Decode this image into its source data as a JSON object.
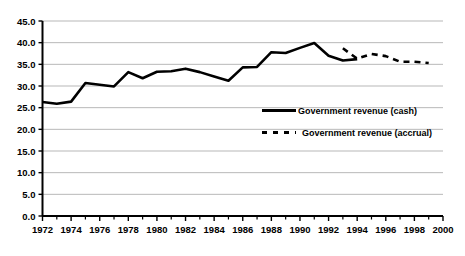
{
  "chart_data": {
    "type": "line",
    "title": "",
    "xlabel": "",
    "ylabel": "",
    "xlim": [
      1972,
      2000
    ],
    "ylim": [
      0.0,
      45.0
    ],
    "y_ticks": [
      "0.0",
      "5.0",
      "10.0",
      "15.0",
      "20.0",
      "25.0",
      "30.0",
      "35.0",
      "40.0",
      "45.0"
    ],
    "y_tick_values": [
      0.0,
      5.0,
      10.0,
      15.0,
      20.0,
      25.0,
      30.0,
      35.0,
      40.0,
      45.0
    ],
    "x_ticks": [
      "1972",
      "1974",
      "1976",
      "1978",
      "1980",
      "1982",
      "1984",
      "1986",
      "1988",
      "1990",
      "1992",
      "1994",
      "1996",
      "1998",
      "2000"
    ],
    "x_tick_values": [
      1972,
      1974,
      1976,
      1978,
      1980,
      1982,
      1984,
      1986,
      1988,
      1990,
      1992,
      1994,
      1996,
      1998,
      2000
    ],
    "x_minor_tick_interval": 1,
    "grid": "horizontal",
    "legend_position": "center-right",
    "series": [
      {
        "name": "Government revenue (cash)",
        "style": "solid",
        "color": "#000000",
        "x": [
          1972,
          1973,
          1974,
          1975,
          1976,
          1977,
          1978,
          1979,
          1980,
          1981,
          1982,
          1983,
          1984,
          1985,
          1986,
          1987,
          1988,
          1989,
          1990,
          1991,
          1992,
          1993,
          1994
        ],
        "values": [
          26.3,
          25.9,
          26.4,
          30.7,
          30.3,
          29.9,
          33.2,
          31.8,
          33.3,
          33.4,
          34.0,
          33.2,
          32.2,
          31.2,
          34.3,
          34.4,
          37.8,
          37.6,
          38.8,
          39.9,
          37.0,
          35.9,
          36.2
        ]
      },
      {
        "name": "Government revenue (accrual)",
        "style": "dashed",
        "color": "#000000",
        "x": [
          1993,
          1994,
          1995,
          1996,
          1997,
          1998,
          1999
        ],
        "values": [
          38.7,
          36.3,
          37.4,
          36.9,
          35.6,
          35.6,
          35.3
        ]
      }
    ]
  },
  "legend": {
    "items": [
      {
        "label": "Government revenue (cash)",
        "style": "solid"
      },
      {
        "label": "Government revenue (accrual)",
        "style": "dashed"
      }
    ]
  }
}
